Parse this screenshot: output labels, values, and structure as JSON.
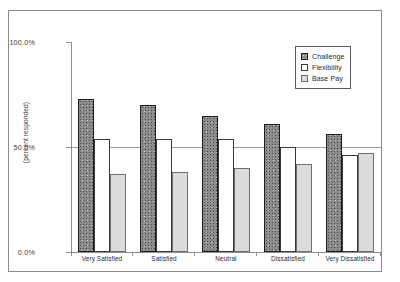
{
  "chart_data": {
    "type": "bar",
    "title": "",
    "subtitle": "",
    "xlabel": "",
    "ylabel": "(percent responded)",
    "categories": [
      "Very Satisfied",
      "Satisfied",
      "Neutral",
      "Dissatisfied",
      "Very Dissatisfied"
    ],
    "series": [
      {
        "name": "Challenge",
        "values": [
          73,
          70,
          65,
          61,
          56
        ]
      },
      {
        "name": "Flexibility",
        "values": [
          54,
          54,
          54,
          50,
          46
        ]
      },
      {
        "name": "Base Pay",
        "values": [
          37,
          38,
          40,
          42,
          47
        ]
      }
    ],
    "ylim": [
      0,
      100
    ],
    "yticks": [
      0,
      50,
      100
    ],
    "ytick_labels": [
      "0.0%",
      "50.0%",
      "100.0%"
    ],
    "grid": "horizontal-at-50",
    "legend_position": "top-right"
  },
  "axis": {
    "y_title": "(percent responded)",
    "y_top_label": "100.0%",
    "y_mid_label": "50.0%",
    "y_bottom_label": "0.0%"
  },
  "legend": {
    "items": [
      {
        "label": "Challenge",
        "swatch": "dark-textured-square",
        "color": "#8c8c8c"
      },
      {
        "label": "Flexibility",
        "swatch": "white-square",
        "color": "#ffffff"
      },
      {
        "label": "Base Pay",
        "swatch": "light-gray-square",
        "color": "#dcdcdc"
      }
    ]
  },
  "categories": {
    "c0": "Very Satisfied",
    "c1": "Satisfied",
    "c2": "Neutral",
    "c3": "Dissatisfied",
    "c4": "Very Dissatisfied"
  },
  "colors": {
    "challenge": "#8c8c8c",
    "flexibility": "#ffffff",
    "base_pay": "#dcdcdc",
    "axis": "#8f8f8f",
    "frame": "#8a8a8a",
    "text": "#1f1f1f"
  }
}
